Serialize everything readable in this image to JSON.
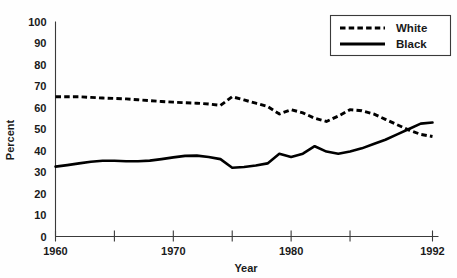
{
  "chart_data": {
    "type": "line",
    "title": "",
    "xlabel": "Year",
    "ylabel": "Percent",
    "xlim": [
      1960,
      1992
    ],
    "ylim": [
      0,
      100
    ],
    "grid": false,
    "legend_position": "top-right",
    "y_ticks": [
      0,
      10,
      20,
      30,
      40,
      50,
      60,
      70,
      80,
      90,
      100
    ],
    "y_tick_labels": [
      "0",
      "10",
      "20",
      "30",
      "40",
      "50",
      "60",
      "70",
      "80",
      "90",
      "100"
    ],
    "x_ticks": [
      1960,
      1965,
      1970,
      1975,
      1980,
      1985,
      1992
    ],
    "x_tick_labels": [
      "1960",
      "",
      "1970",
      "",
      "1980",
      "",
      "1992"
    ],
    "x": [
      1960,
      1961,
      1962,
      1963,
      1964,
      1965,
      1966,
      1967,
      1968,
      1969,
      1970,
      1971,
      1972,
      1973,
      1974,
      1975,
      1976,
      1977,
      1978,
      1979,
      1980,
      1981,
      1982,
      1983,
      1984,
      1985,
      1986,
      1987,
      1988,
      1989,
      1990,
      1991,
      1992
    ],
    "series": [
      {
        "name": "White",
        "style": "dashed",
        "color": "#000000",
        "values": [
          65,
          65,
          65,
          64.7,
          64.4,
          64.2,
          64,
          63.6,
          63.2,
          62.8,
          62.5,
          62.2,
          62,
          61.6,
          61,
          65,
          63.5,
          62,
          60.5,
          57,
          59,
          57.5,
          55,
          53.5,
          56,
          59,
          58.5,
          57,
          54.5,
          52,
          49.5,
          47.5,
          46.5
        ]
      },
      {
        "name": "Black",
        "style": "solid",
        "color": "#000000",
        "values": [
          32.5,
          33.2,
          34,
          34.8,
          35.2,
          35.2,
          35,
          35,
          35.3,
          36,
          36.8,
          37.5,
          37.6,
          37,
          36,
          32,
          32.3,
          33,
          34,
          38.5,
          37,
          38.5,
          42,
          39.5,
          38.5,
          39.5,
          41,
          43,
          45,
          47.5,
          50,
          52.5,
          53
        ]
      }
    ]
  },
  "legend": {
    "entries": [
      {
        "label": "White",
        "style": "dashed"
      },
      {
        "label": "Black",
        "style": "solid"
      }
    ]
  },
  "axes": {
    "y_title": "Percent",
    "x_title": "Year"
  }
}
